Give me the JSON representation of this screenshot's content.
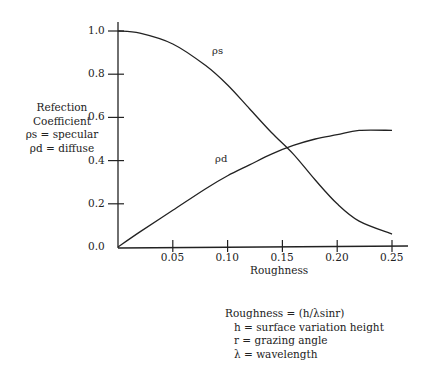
{
  "chart_data": {
    "type": "line",
    "title": "",
    "xlabel": "Roughness",
    "ylabel": "Refection Coefficient",
    "ylabel_lines": [
      "Refection",
      "Coefficient",
      "ρs = specular",
      "ρd = diffuse"
    ],
    "xlim": [
      0,
      0.26
    ],
    "ylim": [
      0,
      1.05
    ],
    "x_ticks": [
      0.05,
      0.1,
      0.15,
      0.2,
      0.25
    ],
    "x_tick_labels": [
      "0.05",
      "0.10",
      "0.15",
      "0.20",
      "0.25"
    ],
    "y_ticks": [
      0.0,
      0.2,
      0.4,
      0.6,
      0.8,
      1.0
    ],
    "y_tick_labels": [
      "0.0",
      "0.2",
      "0.4",
      "0.6",
      "0.8",
      "1.0"
    ],
    "grid": false,
    "series": [
      {
        "name": "ρs",
        "label": "ρs",
        "x": [
          0,
          0.02,
          0.05,
          0.08,
          0.1,
          0.12,
          0.14,
          0.16,
          0.18,
          0.2,
          0.22,
          0.25
        ],
        "values": [
          1.0,
          0.99,
          0.94,
          0.84,
          0.75,
          0.64,
          0.53,
          0.43,
          0.31,
          0.2,
          0.12,
          0.06
        ]
      },
      {
        "name": "ρd",
        "label": "ρd",
        "x": [
          0,
          0.02,
          0.05,
          0.08,
          0.1,
          0.12,
          0.14,
          0.16,
          0.18,
          0.2,
          0.22,
          0.25
        ],
        "values": [
          0.0,
          0.07,
          0.17,
          0.27,
          0.33,
          0.38,
          0.43,
          0.47,
          0.5,
          0.52,
          0.54,
          0.54
        ]
      }
    ],
    "annotations": [
      "Roughness = (h/λsinr)",
      "h = surface variation height",
      "r = grazing angle",
      "λ = wavelength"
    ]
  },
  "labels": {
    "ylab": [
      "Refection",
      "Coefficient",
      "ρs = specular",
      "ρd = diffuse"
    ],
    "xlabel": "Roughness",
    "series_s": "ρs",
    "series_d": "ρd",
    "legend": [
      "Roughness = (h/λsinr)",
      "h = surface variation height",
      "r = grazing angle",
      "λ = wavelength"
    ]
  }
}
